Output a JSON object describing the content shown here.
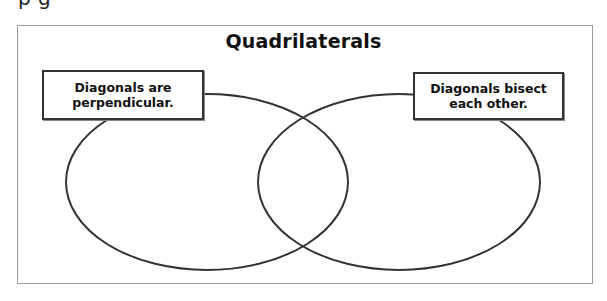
{
  "clipped_heading": {
    "text": "p        g"
  },
  "diagram": {
    "type": "venn",
    "title": "Quadrilaterals",
    "colors": {
      "frame": "#9a9a9a",
      "outline": "#333333",
      "background": "#ffffff"
    },
    "sets": [
      {
        "id": "left",
        "label_line1": "Diagonals are",
        "label_line2": "perpendicular."
      },
      {
        "id": "right",
        "label_line1": "Diagonals bisect",
        "label_line2": "each other."
      }
    ]
  }
}
